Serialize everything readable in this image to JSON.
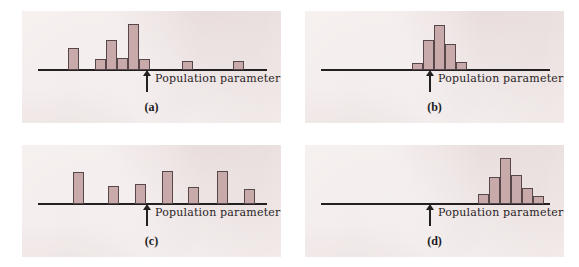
{
  "figure": {
    "panel_background": "#efe4e3",
    "page_background": "#ffffff",
    "bar_fill": "#c9aaab",
    "bar_stroke": "#57474a",
    "axis_color": "#241f20",
    "marker_label": "Population parameter",
    "marker_icon": "up-arrow-icon"
  },
  "panels": [
    {
      "id": "a",
      "caption": "(a)",
      "marker_label": "Population parameter",
      "axis_y": 58,
      "param_x": 124,
      "chart_data": {
        "type": "bar",
        "title": "(a)",
        "xlabel": "",
        "ylabel": "",
        "annotations": [
          "Population parameter"
        ],
        "grid": false,
        "legend": null,
        "axis_range_x": [
          0,
          259
        ],
        "bar_width": 11,
        "x": [
          46,
          73,
          84,
          95,
          106,
          117,
          160,
          211
        ],
        "values": [
          22,
          11,
          30,
          12,
          46,
          11,
          9,
          9
        ]
      }
    },
    {
      "id": "b",
      "caption": "(b)",
      "marker_label": "Population parameter",
      "axis_y": 58,
      "param_x": 124,
      "chart_data": {
        "type": "bar",
        "title": "(b)",
        "xlabel": "",
        "ylabel": "",
        "annotations": [
          "Population parameter"
        ],
        "grid": false,
        "legend": null,
        "axis_range_x": [
          0,
          259
        ],
        "bar_width": 11,
        "x": [
          107,
          118,
          129,
          140,
          151
        ],
        "values": [
          7,
          30,
          45,
          26,
          8
        ]
      }
    },
    {
      "id": "c",
      "caption": "(c)",
      "marker_label": "Population parameter",
      "axis_y": 58,
      "param_x": 124,
      "chart_data": {
        "type": "bar",
        "title": "(c)",
        "xlabel": "",
        "ylabel": "",
        "annotations": [
          "Population parameter"
        ],
        "grid": false,
        "legend": null,
        "axis_range_x": [
          0,
          259
        ],
        "bar_width": 11,
        "x": [
          51,
          86,
          113,
          140,
          166,
          195,
          222
        ],
        "values": [
          32,
          18,
          20,
          33,
          17,
          33,
          15
        ]
      }
    },
    {
      "id": "d",
      "caption": "(d)",
      "marker_label": "Population parameter",
      "axis_y": 58,
      "param_x": 124,
      "chart_data": {
        "type": "bar",
        "title": "(d)",
        "xlabel": "",
        "ylabel": "",
        "annotations": [
          "Population parameter"
        ],
        "grid": false,
        "legend": null,
        "axis_range_x": [
          0,
          259
        ],
        "bar_width": 11,
        "x": [
          173,
          184,
          195,
          206,
          217,
          228
        ],
        "values": [
          10,
          27,
          46,
          29,
          16,
          8
        ]
      }
    }
  ]
}
